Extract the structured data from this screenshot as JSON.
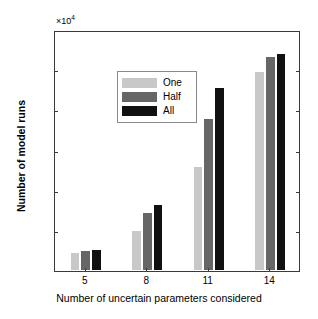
{
  "chart_data": {
    "type": "bar",
    "title": "",
    "xlabel": "Number of uncertain parameters considered",
    "ylabel": "Number of model runs",
    "categories": [
      "5",
      "8",
      "11",
      "14"
    ],
    "series": [
      {
        "name": "One",
        "color": "#c8c8c8",
        "values": [
          2400,
          5100,
          13100,
          24900
        ]
      },
      {
        "name": "Half",
        "color": "#666666",
        "values": [
          2600,
          7400,
          19000,
          26800
        ]
      },
      {
        "name": "All",
        "color": "#111111",
        "values": [
          2700,
          8400,
          22900,
          27200
        ]
      }
    ],
    "ylim": [
      0,
      30000
    ],
    "yticks": [
      0,
      5000,
      10000,
      15000,
      20000,
      25000,
      30000
    ],
    "ytick_labels": [
      "0",
      "0.5",
      "1",
      "1.5",
      "2",
      "2.5",
      "3"
    ],
    "y_exponent_base": "×10",
    "y_exponent_power": "4",
    "grid": false,
    "legend_position": "top-left",
    "legend_entries": [
      "One",
      "Half",
      "All"
    ]
  }
}
